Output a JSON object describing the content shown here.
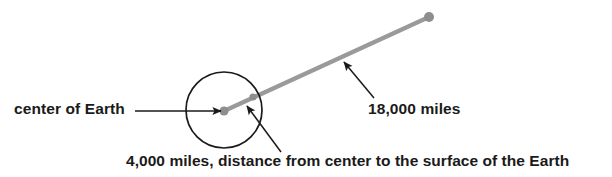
{
  "diagram": {
    "type": "geometry-schematic",
    "canvas": {
      "width": 612,
      "height": 177,
      "background": "#ffffff"
    },
    "colors": {
      "stroke_dark": "#1a1a1a",
      "orbit_line": "#9a9a9a",
      "point_marker": "#8e8e8e",
      "text": "#1a1a1a",
      "background": "#ffffff"
    },
    "labels": {
      "center_of_earth": "center of Earth",
      "orbit_distance": "18,000 miles",
      "radius_caption": "4,000 miles, distance from center to the surface of the Earth"
    },
    "shapes": {
      "earth_circle": {
        "cx": 224,
        "cy": 110,
        "r": 38,
        "stroke": "#1a1a1a",
        "stroke_width": 1.7,
        "fill": "none"
      },
      "center_point": {
        "cx": 224,
        "cy": 111,
        "r": 4.6,
        "fill": "#8e8e8e"
      },
      "orbit_endpoint": {
        "cx": 429,
        "cy": 17,
        "r": 5.0,
        "fill": "#8e8e8e"
      },
      "surface_point": {
        "cx": 253,
        "cy": 97,
        "r": 3.6,
        "fill": "#8e8e8e"
      },
      "orbit_ray": {
        "x1": 224,
        "y1": 111,
        "x2": 429,
        "y2": 17,
        "stroke": "#9a9a9a",
        "stroke_width": 4.2
      }
    },
    "leaders": {
      "center_leader": {
        "x1": 135,
        "y1": 111,
        "x2": 221,
        "y2": 111,
        "arrow": "end"
      },
      "orbit_leader": {
        "x1": 374,
        "y1": 98,
        "x2": 344,
        "y2": 62,
        "arrow": "end"
      },
      "radius_leader": {
        "x1": 281,
        "y1": 152,
        "x2": 247,
        "y2": 106,
        "arrow": "end"
      }
    }
  }
}
